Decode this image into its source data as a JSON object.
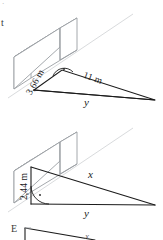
{
  "document": {
    "type": "geometry-figure-sheet",
    "background_color": "#ffffff",
    "ink_color": "#1a1a1a",
    "guide_color": "#d5d7da",
    "edge_color": "#9a9ea3"
  },
  "margin_marks": {
    "top_mark": "·",
    "item_letter": "t"
  },
  "figures": [
    {
      "id": "figure-1",
      "name": "wall-with-right-triangle-upper",
      "shape": "rectangular wall slab in oblique projection with a right triangle at its base",
      "labels": {
        "height": "3,66 m",
        "hypotenuse": "11 m",
        "base": "y"
      },
      "angle_markers": [
        "right-angle-dot-arc"
      ]
    },
    {
      "id": "figure-2",
      "name": "wall-with-right-triangle-lower",
      "shape": "rectangular wall slab in oblique projection with a right triangle at its base",
      "labels": {
        "height": "2,44 m",
        "hypotenuse": "x",
        "base": "y"
      },
      "angle_markers": [
        "right-angle-dot-arc"
      ]
    },
    {
      "id": "figure-3",
      "name": "wall-with-right-triangle-partial",
      "shape": "partially visible third figure cropped at page bottom",
      "labels": {
        "item_letter": "E",
        "hypotenuse": "x"
      },
      "angle_markers": []
    }
  ]
}
